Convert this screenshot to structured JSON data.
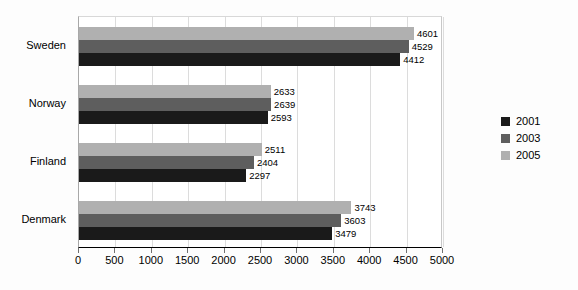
{
  "chart_data": {
    "type": "bar",
    "orientation": "horizontal",
    "title": "",
    "xlabel": "",
    "ylabel": "",
    "categories": [
      "Sweden",
      "Norway",
      "Finland",
      "Denmark"
    ],
    "series": [
      {
        "name": "2001",
        "color": "#1a1a1a",
        "values": [
          4412,
          2593,
          2297,
          3479
        ]
      },
      {
        "name": "2003",
        "color": "#5e5e5e",
        "values": [
          4529,
          2639,
          2404,
          3603
        ]
      },
      {
        "name": "2005",
        "color": "#b0b0b0",
        "values": [
          4601,
          2633,
          2511,
          3743
        ]
      }
    ],
    "xlim": [
      0,
      5000
    ],
    "xticks": [
      0,
      500,
      1000,
      1500,
      2000,
      2500,
      3000,
      3500,
      4000,
      4500,
      5000
    ],
    "xtick_labels": [
      "0",
      "500",
      "1000",
      "1500",
      "2000",
      "2500",
      "3000",
      "3500",
      "4000",
      "4500",
      "5000"
    ],
    "grid": true,
    "grid_axis": "x",
    "data_labels": true,
    "legend_position": "right",
    "legend_entries": [
      "2001",
      "2003",
      "2005"
    ],
    "background_color": "#fdfdfd",
    "plot_background_color": "#ffffff",
    "gridline_color": "#dcdcdc",
    "axis_color": "#000000"
  }
}
